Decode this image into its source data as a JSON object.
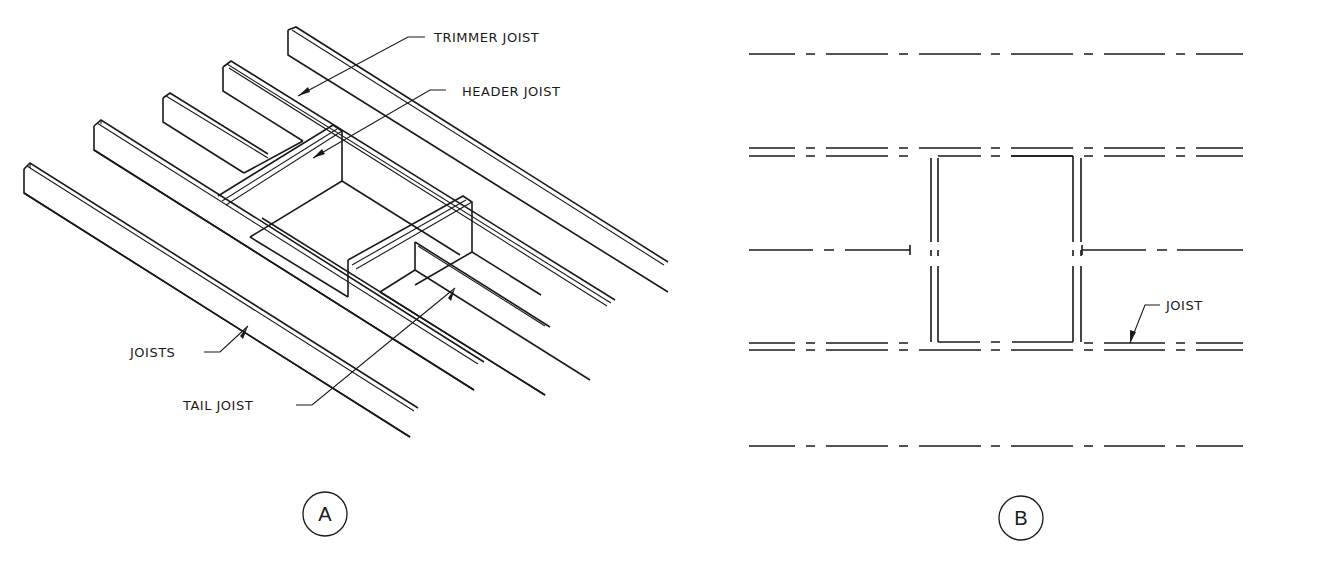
{
  "figure_a": {
    "caption": "A",
    "labels": {
      "trimmer_joist": "TRIMMER JOIST",
      "header_joist": "HEADER JOIST",
      "joists": "JOISTS",
      "tail_joist": "TAIL JOIST"
    }
  },
  "figure_b": {
    "caption": "B",
    "labels": {
      "joist": "JOIST"
    }
  },
  "colors": {
    "line": "#1a1a1a",
    "background": "#ffffff"
  }
}
